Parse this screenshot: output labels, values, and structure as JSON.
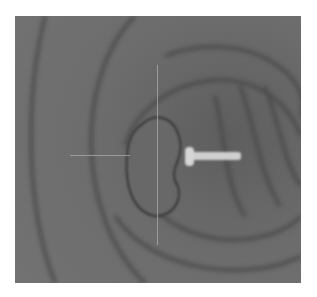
{
  "image": {
    "description": "Grayscale endoscopic view of a lumen with concentric mucosal folds, a rounded polypoid lesion at center, crosshair marker lines and a white arrow pointing at the lesion",
    "colors": {
      "background": "#6a6a6a",
      "fold_shadow": "#4a4a4a",
      "lesion": "#666666",
      "arrow": "#cfcfcf",
      "crosshair": "#a8a8a8"
    },
    "crosshair": {
      "horizontal": {
        "x1": 70,
        "x2": 130,
        "y": 155
      },
      "vertical": {
        "x": 157,
        "y1": 65,
        "y2": 245
      }
    },
    "arrow": {
      "x_tail": 240,
      "x_head": 185,
      "y": 158,
      "direction": "left"
    }
  }
}
